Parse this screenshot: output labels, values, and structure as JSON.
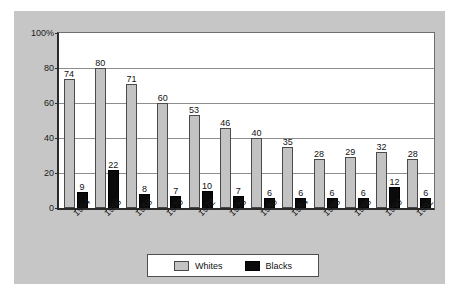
{
  "chart_data": {
    "type": "bar",
    "title": "",
    "xlabel": "",
    "ylabel": "",
    "ylim": [
      0,
      100
    ],
    "yticks": [
      "0",
      "20",
      "40",
      "60",
      "80",
      "100%"
    ],
    "ytick_values": [
      0,
      20,
      40,
      60,
      80,
      100
    ],
    "grid": true,
    "legend_position": "bottom-center",
    "categories": [
      "1964",
      "1966",
      "1968",
      "1970",
      "1972",
      "1976",
      "1980",
      "1984",
      "1986",
      "1988",
      "1990",
      "1992"
    ],
    "series": [
      {
        "name": "Whites",
        "color": "#c3c3c3",
        "values": [
          74,
          80,
          71,
          60,
          53,
          46,
          40,
          35,
          28,
          29,
          32,
          28
        ]
      },
      {
        "name": "Blacks",
        "color": "#0a0a0a",
        "values": [
          9,
          22,
          8,
          7,
          10,
          7,
          6,
          6,
          6,
          6,
          12,
          6
        ]
      }
    ]
  },
  "legend": {
    "items": [
      {
        "label": "Whites",
        "swatch": "whites"
      },
      {
        "label": "Blacks",
        "swatch": "blacks"
      }
    ]
  },
  "colors": {
    "figure_background": "#c6c6c6",
    "plot_background": "#ffffff",
    "axis": "#2b2b2b",
    "gridline": "#8d8d8d",
    "whites_bar": "#c3c3c3",
    "blacks_bar": "#0a0a0a"
  }
}
